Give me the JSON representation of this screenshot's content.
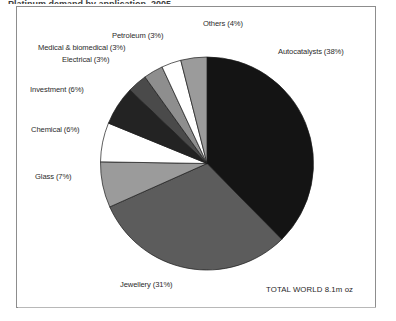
{
  "caption": {
    "text": "Platinum demand by application, 2005"
  },
  "total_note": "TOTAL WORLD 8.1m oz",
  "colors": {
    "autocatalysts": "#141414",
    "jewellery": "#5c5c5c",
    "glass": "#9b9b9b",
    "chemical": "#ffffff",
    "investment": "#232323",
    "electrical": "#4a4a4a",
    "medical": "#8e8e8e",
    "petroleum": "#ffffff",
    "others": "#9b9b9b",
    "stroke": "#1a1a1a",
    "frame": "#8d8d8d",
    "text": "#2b2b2b"
  },
  "chart_data": {
    "type": "pie",
    "title": "Platinum demand by application, 2005",
    "unit": "m oz",
    "total": "8.1",
    "total_label": "TOTAL WORLD 8.1m oz",
    "start_angle_deg": 0,
    "direction": "clockwise",
    "legend": "none-labels-around-pie",
    "categories": [
      "Autocatalysts",
      "Jewellery",
      "Glass",
      "Chemical",
      "Investment",
      "Electrical",
      "Medical & biomedical",
      "Petroleum",
      "Others"
    ],
    "values": [
      38,
      31,
      7,
      6,
      6,
      3,
      3,
      3,
      4
    ],
    "slices": [
      {
        "label": "Autocatalysts (38%)",
        "name": "Autocatalysts",
        "value": 38,
        "color": "#141414"
      },
      {
        "label": "Jewellery (31%)",
        "name": "Jewellery",
        "value": 31,
        "color": "#5c5c5c"
      },
      {
        "label": "Glass (7%)",
        "name": "Glass",
        "value": 7,
        "color": "#9b9b9b"
      },
      {
        "label": "Chemical (6%)",
        "name": "Chemical",
        "value": 6,
        "color": "#ffffff"
      },
      {
        "label": "Investment (6%)",
        "name": "Investment",
        "value": 6,
        "color": "#232323"
      },
      {
        "label": "Electrical (3%)",
        "name": "Electrical",
        "value": 3,
        "color": "#4a4a4a"
      },
      {
        "label": "Medical & biomedical (3%)",
        "name": "Medical & biomedical",
        "value": 3,
        "color": "#8e8e8e"
      },
      {
        "label": "Petroleum (3%)",
        "name": "Petroleum",
        "value": 3,
        "color": "#ffffff"
      },
      {
        "label": "Others (4%)",
        "name": "Others",
        "value": 4,
        "color": "#9b9b9b"
      }
    ]
  }
}
